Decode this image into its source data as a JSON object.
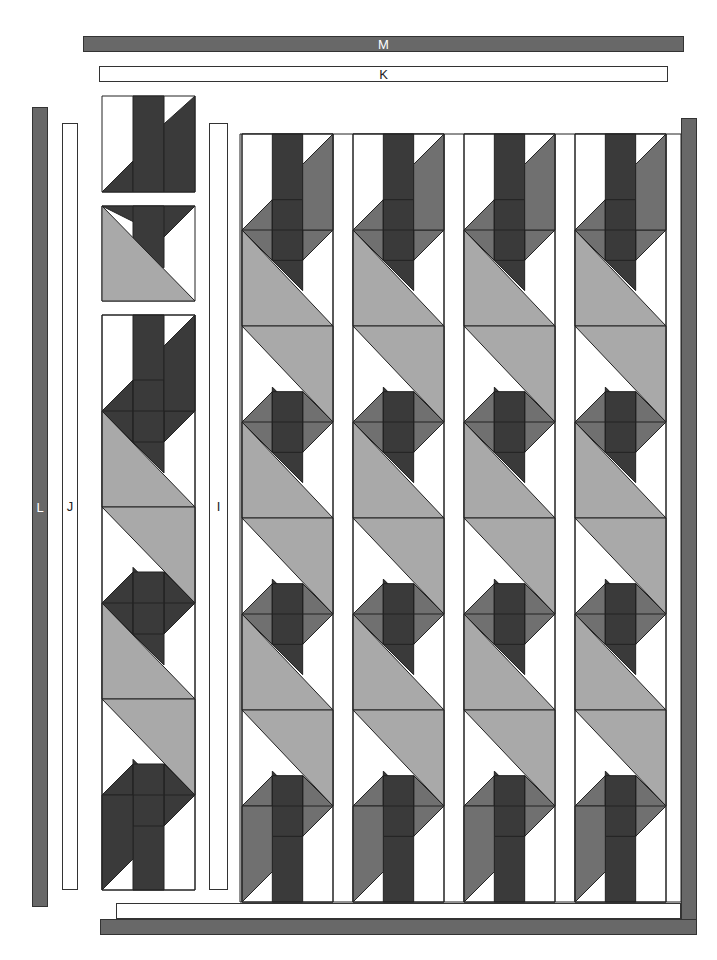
{
  "labels": {
    "M": "M",
    "K": "K",
    "L": "L",
    "J": "J",
    "I": "I"
  },
  "colors": {
    "white": "#ffffff",
    "light": "#a9a9a9",
    "mid": "#707070",
    "dark": "#3a3a3a",
    "border": "#686868",
    "line": "#222222"
  },
  "strips": {
    "M": {
      "x": 83,
      "y": 36,
      "w": 601,
      "h": 16,
      "fill": "dark"
    },
    "K": {
      "x": 99,
      "y": 66,
      "w": 569,
      "h": 16,
      "fill": "light"
    },
    "L": {
      "x": 32,
      "y": 107,
      "w": 16,
      "h": 800,
      "fill": "dark"
    },
    "J": {
      "x": 62,
      "y": 123,
      "w": 16,
      "h": 767,
      "fill": "light"
    },
    "I": {
      "x": 209,
      "y": 123,
      "w": 19,
      "h": 767,
      "fill": "light"
    },
    "right_border": {
      "x": 681,
      "y": 118,
      "w": 16,
      "h": 803,
      "fill": "dark"
    },
    "bottom_inner": {
      "x": 116,
      "y": 903,
      "w": 565,
      "h": 16,
      "fill": "light"
    },
    "bottom_border": {
      "x": 100,
      "y": 919,
      "w": 597,
      "h": 16,
      "fill": "dark"
    }
  },
  "left_column": {
    "x": 102,
    "w": 93,
    "blocks": [
      {
        "type": "top-cap",
        "y": 96,
        "h": 96
      },
      {
        "type": "hst-with-strip",
        "y": 206,
        "h": 95
      },
      {
        "type": "repeat",
        "y": 315,
        "h": 575
      }
    ]
  },
  "main_grid": {
    "top": 134,
    "bottom": 902,
    "sashing_left": 240,
    "sashing_right": 681,
    "columns": [
      {
        "x": 242,
        "w": 91
      },
      {
        "x": 353,
        "w": 91
      },
      {
        "x": 464,
        "w": 91
      },
      {
        "x": 575,
        "w": 91
      }
    ],
    "column_count": 4,
    "row_unit": 96
  }
}
